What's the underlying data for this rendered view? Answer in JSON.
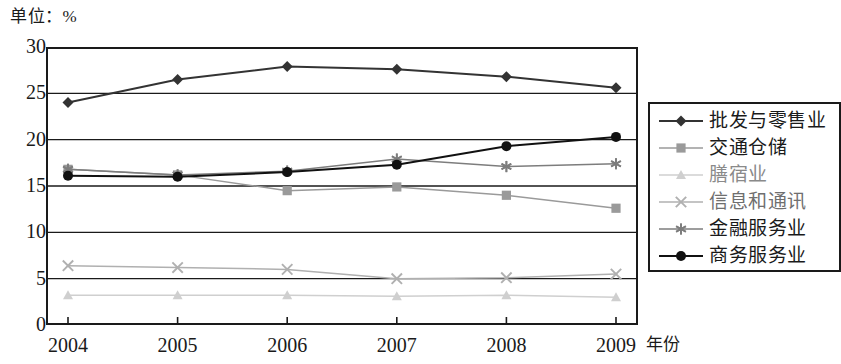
{
  "chart_data": {
    "type": "line",
    "title": "单位：%",
    "xlabel": "年份",
    "ylabel": "",
    "categories": [
      "2004",
      "2005",
      "2006",
      "2007",
      "2008",
      "2009"
    ],
    "x": [
      2004,
      2005,
      2006,
      2007,
      2008,
      2009
    ],
    "ylim": [
      0,
      30
    ],
    "yticks": [
      0,
      5,
      10,
      15,
      20,
      25,
      30
    ],
    "grid": true,
    "legend_position": "right",
    "series": [
      {
        "name": "批发与零售业",
        "marker": "diamond",
        "color": "#333333",
        "values": [
          24.0,
          26.5,
          27.9,
          27.6,
          26.8,
          25.6
        ]
      },
      {
        "name": "交通仓储",
        "marker": "square",
        "color": "#9a9a9a",
        "values": [
          16.8,
          16.2,
          14.5,
          14.9,
          14.0,
          12.6
        ]
      },
      {
        "name": "膳宿业",
        "marker": "triangle",
        "color": "#cfcfcf",
        "values": [
          3.2,
          3.2,
          3.2,
          3.1,
          3.2,
          3.0
        ]
      },
      {
        "name": "信息和通讯",
        "marker": "x",
        "color": "#b0b0b0",
        "values": [
          6.4,
          6.2,
          6.0,
          5.0,
          5.1,
          5.5
        ]
      },
      {
        "name": "金融服务业",
        "marker": "asterisk",
        "color": "#7d7d7d",
        "values": [
          16.8,
          16.2,
          16.6,
          17.9,
          17.1,
          17.4
        ]
      },
      {
        "name": "商务服务业",
        "marker": "circle",
        "color": "#111111",
        "values": [
          16.1,
          16.0,
          16.5,
          17.3,
          19.3,
          20.3
        ]
      }
    ]
  },
  "axis": {
    "y_tick_labels": [
      "30",
      "25",
      "20",
      "15",
      "10",
      "5",
      "0"
    ],
    "x_tick_labels": [
      "2004",
      "2005",
      "2006",
      "2007",
      "2008",
      "2009"
    ],
    "x_axis_title": "年份",
    "unit_label": "单位：%"
  },
  "legend": {
    "items": [
      {
        "label": "批发与零售业",
        "marker": "diamond-marker",
        "color": "#333333"
      },
      {
        "label": "交通仓储",
        "marker": "square-marker",
        "color": "#9a9a9a"
      },
      {
        "label": "膳宿业",
        "marker": "triangle-marker",
        "color": "#cfcfcf"
      },
      {
        "label": "信息和通讯",
        "marker": "x-marker",
        "color": "#b0b0b0"
      },
      {
        "label": "金融服务业",
        "marker": "asterisk-marker",
        "color": "#7d7d7d"
      },
      {
        "label": "商务服务业",
        "marker": "circle-marker",
        "color": "#111111"
      }
    ]
  }
}
